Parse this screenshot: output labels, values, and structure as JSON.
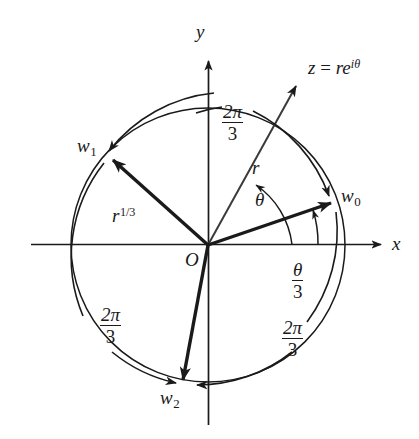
{
  "figure": {
    "type": "complex-plane-cube-roots-diagram",
    "background_color": "#ffffff",
    "stroke_color": "#1a1a1a",
    "origin": {
      "x": 208,
      "y": 245
    },
    "circle_radius": 137
  },
  "axes": {
    "x_label": "x",
    "y_label": "y",
    "origin_label": "O"
  },
  "vectors": {
    "z": {
      "label_z": "z",
      "label_eq": " = ",
      "label_r": "r",
      "label_e": "e",
      "label_exp_i": "i",
      "label_exp_theta": "θ",
      "magnitude_label": "r",
      "angle_label": "θ",
      "angle_deg": 57
    },
    "w0": {
      "label_base": "w",
      "label_sub": "0",
      "angle_deg": 19
    },
    "w1": {
      "label_base": "w",
      "label_sub": "1",
      "angle_deg": 139
    },
    "w2": {
      "label_base": "w",
      "label_sub": "2",
      "angle_deg": 259
    },
    "radius_label": {
      "base": "r",
      "exponent": "1/3"
    }
  },
  "angle_arcs": {
    "theta_over_three": {
      "numerator": "θ",
      "denominator": "3"
    },
    "two_pi_over_three_top": {
      "numerator": "2π",
      "denominator": "3"
    },
    "two_pi_over_three_lower_left": {
      "numerator": "2π",
      "denominator": "3"
    },
    "two_pi_over_three_lower_right": {
      "numerator": "2π",
      "denominator": "3"
    }
  }
}
